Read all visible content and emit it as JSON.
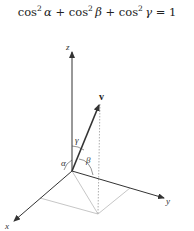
{
  "equation": {
    "text": "cos² α + cos² β + cos² γ = 1",
    "parts": {
      "cos": "cos",
      "sq": "2",
      "alpha": "α",
      "beta": "β",
      "gamma": "γ",
      "plus": " + ",
      "eq": " = 1"
    }
  },
  "diagram": {
    "axes": {
      "x": "x",
      "y": "y",
      "z": "z"
    },
    "vector": "v",
    "angles": {
      "alpha": "α",
      "beta": "β",
      "gamma": "γ"
    },
    "colors": {
      "axis": "#333333",
      "vector": "#333333",
      "guide": "#b0b0b0",
      "dotted": "#999999"
    }
  }
}
